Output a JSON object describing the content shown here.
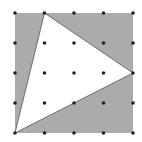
{
  "diagram": {
    "type": "dot-grid-geometry",
    "grid": {
      "rows": 5,
      "cols": 5,
      "x_positions": [
        15,
        44.5,
        74,
        103.5,
        133
      ],
      "y_positions": [
        13,
        43,
        73,
        103,
        133
      ],
      "dot_radius": 1.8,
      "dot_color": "#222222"
    },
    "square": {
      "x": 15,
      "y": 13,
      "width": 118,
      "height": 120,
      "fill": "#ababab"
    },
    "triangle": {
      "grid_vertices": [
        [
          1,
          0
        ],
        [
          4,
          2
        ],
        [
          0,
          4
        ]
      ],
      "points": "44.5,13 133,73 15,133",
      "fill": "#ffffff",
      "stroke": "#555555"
    }
  }
}
